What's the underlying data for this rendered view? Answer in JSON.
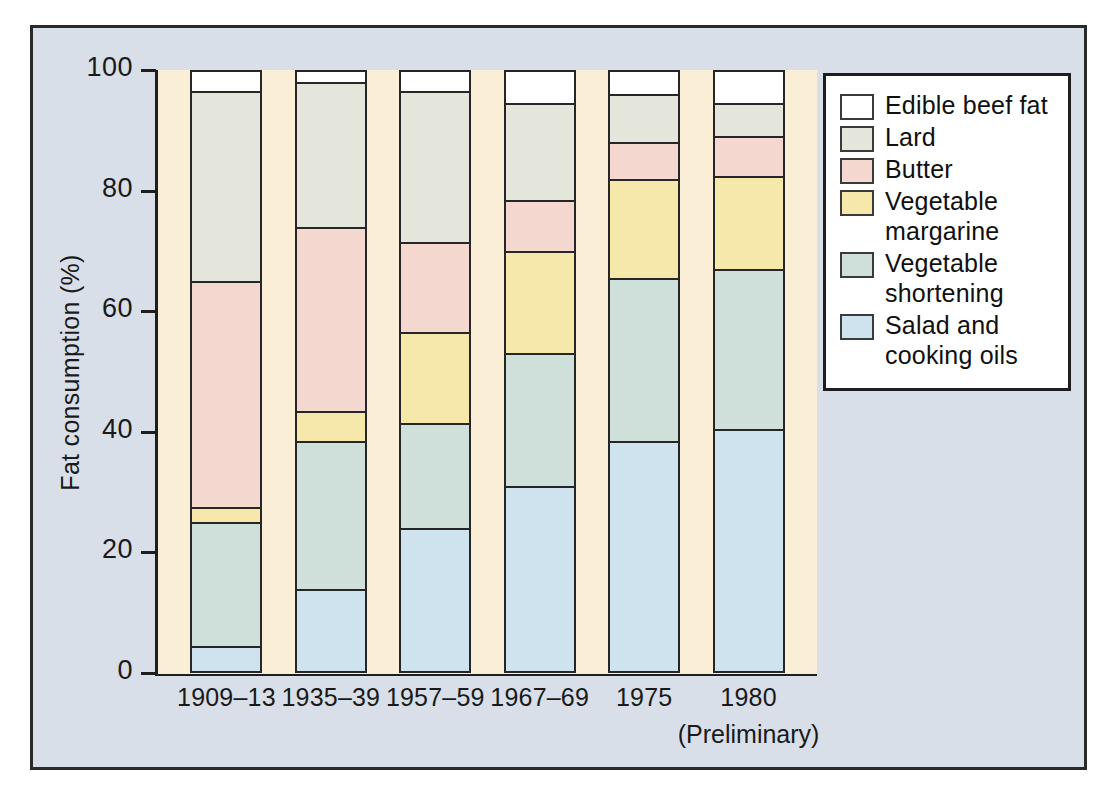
{
  "chart_data": {
    "type": "bar",
    "stacked": true,
    "title": "",
    "xlabel": "",
    "ylabel": "Fat consumption (%)",
    "ylim": [
      0,
      100
    ],
    "yticks": [
      0,
      20,
      40,
      60,
      80,
      100
    ],
    "ytick_labels": [
      "0",
      "20",
      "40",
      "60",
      "80",
      "100"
    ],
    "grid": false,
    "legend_position": "right",
    "categories": [
      "1909–13",
      "1935–39",
      "1957–59",
      "1967–69",
      "1975",
      "1980"
    ],
    "category_sublabels": [
      "",
      "",
      "",
      "",
      "",
      "(Preliminary)"
    ],
    "series": [
      {
        "name": "Salad and cooking oils",
        "legend_line1": "Salad and",
        "legend_line2": "cooking oils",
        "color": "#cfe3ee",
        "values": [
          4.5,
          14.0,
          24.0,
          31.0,
          38.5,
          40.5
        ]
      },
      {
        "name": "Vegetable shortening",
        "legend_line1": "Vegetable",
        "legend_line2": "shortening",
        "color": "#cfe0db",
        "values": [
          20.5,
          24.5,
          17.5,
          22.0,
          27.0,
          26.5
        ]
      },
      {
        "name": "Vegetable margarine",
        "legend_line1": "Vegetable",
        "legend_line2": "margarine",
        "color": "#f6e8ab",
        "values": [
          2.5,
          5.0,
          15.0,
          17.0,
          16.5,
          15.5
        ]
      },
      {
        "name": "Butter",
        "legend_line1": "Butter",
        "legend_line2": "",
        "color": "#f4d7cf",
        "values": [
          37.5,
          30.5,
          15.0,
          8.5,
          6.0,
          6.5
        ]
      },
      {
        "name": "Lard",
        "legend_line1": "Lard",
        "legend_line2": "",
        "color": "#e4e6dc",
        "values": [
          31.5,
          24.0,
          25.0,
          16.0,
          8.0,
          5.5
        ]
      },
      {
        "name": "Edible beef fat",
        "legend_line1": "Edible beef fat",
        "legend_line2": "",
        "color": "#ffffff",
        "values": [
          3.5,
          2.0,
          3.5,
          5.5,
          4.0,
          5.5
        ]
      }
    ],
    "cumulative_tops": [
      [
        4.5,
        25.0,
        27.5,
        65.0,
        96.5,
        100.0
      ],
      [
        14.0,
        38.5,
        43.5,
        74.0,
        98.0,
        100.0
      ],
      [
        24.0,
        41.5,
        56.5,
        71.5,
        96.5,
        100.0
      ],
      [
        31.0,
        53.0,
        70.0,
        78.5,
        94.5,
        100.0
      ],
      [
        38.5,
        65.5,
        82.0,
        88.0,
        96.0,
        100.0
      ],
      [
        40.5,
        67.0,
        82.5,
        89.0,
        94.5,
        100.0
      ]
    ]
  },
  "colors": {
    "panel_background": "#d8dfe8",
    "plot_background": "#faeed7",
    "frame": "#2a2a2a",
    "axis": "#1e1e1e",
    "segment_outline": "#262626",
    "legend_background": "#ffffff"
  }
}
